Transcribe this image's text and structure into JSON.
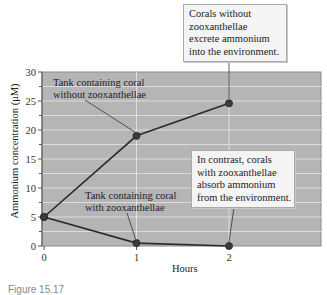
{
  "chart_data": {
    "type": "line",
    "title": "",
    "xlabel": "Hours",
    "ylabel": "Ammonium concentration (μM)",
    "x": [
      0,
      1,
      2
    ],
    "x_ticks": [
      "0",
      "1",
      "2"
    ],
    "y_ticks": [
      "0",
      "5",
      "10",
      "15",
      "20",
      "25",
      "30"
    ],
    "xlim": [
      0,
      3
    ],
    "ylim": [
      0,
      30
    ],
    "grid": true,
    "background_color": "#b5b5b5",
    "gridline_color": "#dcdcdc",
    "line_color": "#2b2b2b",
    "series": [
      {
        "name": "Tank containing coral without zooxanthellae",
        "values": [
          5,
          19,
          24.6
        ]
      },
      {
        "name": "Tank containing coral with zooxanthellae",
        "values": [
          5,
          0.5,
          0
        ]
      }
    ],
    "annotations": [
      {
        "text": "Tank containing coral without zooxanthellae",
        "points_to": {
          "x": 1,
          "y": 19
        }
      },
      {
        "text": "Tank containing coral with zooxanthellae",
        "points_to": {
          "x": 1,
          "y": 0.5
        }
      },
      {
        "text": "Corals without zooxanthellae excrete ammonium into the environment.",
        "points_to": {
          "x": 2,
          "y": 24.6
        }
      },
      {
        "text": "In contrast, corals with zooxanthellae absorb ammonium from the environment.",
        "points_to": {
          "x": 2,
          "y": 0
        }
      }
    ]
  },
  "labels": {
    "series1_line1": "Tank containing coral",
    "series1_line2": "without zooxanthellae",
    "series2_line1": "Tank containing coral",
    "series2_line2": "with zooxanthellae",
    "callout_top": [
      "Corals without",
      "zooxanthellae",
      "excrete ammonium",
      "into the environment."
    ],
    "callout_bottom": [
      "In contrast, corals",
      "with zooxanthellae",
      "absorb ammonium",
      "from the environment."
    ],
    "xlabel": "Hours",
    "ylabel": "Ammonium concentration (μM)",
    "caption": "Figure 15.17"
  }
}
